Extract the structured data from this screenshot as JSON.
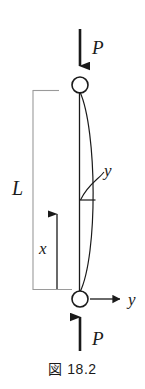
{
  "figure": {
    "caption": "図 18.2",
    "caption_prefix": "図",
    "caption_number": "18.2",
    "background_color": "#ffffff",
    "line_color": "#1a1a1a",
    "dimension_line_color": "#9a9a9a"
  },
  "labels": {
    "load_top": "P",
    "load_bottom": "P",
    "length": "L",
    "axis_x": "x",
    "axis_y": "y",
    "deflection": "y"
  },
  "geometry": {
    "column_top_x": 80,
    "column_top_y": 85,
    "column_bottom_x": 80,
    "column_bottom_y": 299,
    "pin_radius": 8,
    "curve_peak_x": 95,
    "deflection_tick_y": 200,
    "dimension_bracket_x": 33,
    "dimension_top_y": 90,
    "dimension_bottom_y": 290,
    "x_axis_arrow_tip_y": 204,
    "y_axis_arrow_tip_x": 126
  },
  "elements": {
    "top_pin_name": "pin-support-top",
    "bottom_pin_name": "pin-support-bottom",
    "column_axis_name": "column-centerline",
    "buckled_curve_name": "buckled-column-curve"
  }
}
